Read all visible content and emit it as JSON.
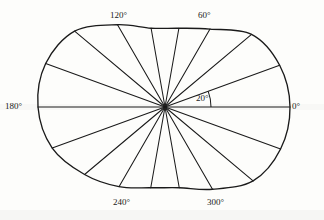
{
  "figure": {
    "title": "",
    "background_color": "#fdfdfb",
    "line_color": "#1a1a1a",
    "center": {
      "x": 165,
      "y": 107
    }
  },
  "labels": {
    "deg0": "0°",
    "deg20": "20°",
    "deg60": "60°",
    "deg120": "120°",
    "deg180": "180°",
    "deg240": "240°",
    "deg300": "300°"
  },
  "chart_data": {
    "type": "line",
    "subtype": "polar-closed-contour",
    "title": "",
    "xlabel": "",
    "ylabel": "",
    "angle_unit": "degrees",
    "angle_step": 20,
    "spoke_count": 18,
    "grid": false,
    "legend": false,
    "axis_labels_shown": [
      "0°",
      "20°",
      "60°",
      "120°",
      "180°",
      "240°",
      "300°"
    ],
    "angle_arc_annotation": {
      "label": "20°",
      "from_angle": 0,
      "to_angle": 20,
      "arc_radius": 46
    },
    "angles": [
      0,
      20,
      40,
      60,
      80,
      100,
      120,
      140,
      160,
      180,
      200,
      220,
      240,
      260,
      280,
      300,
      320,
      340
    ],
    "radii": [
      125,
      122,
      113,
      90,
      80,
      80,
      95,
      118,
      127,
      127,
      120,
      105,
      92,
      82,
      82,
      95,
      115,
      123
    ],
    "radius_units": "px",
    "rlim": [
      0,
      130
    ],
    "series": [
      {
        "name": "pattern-contour",
        "angles": [
          0,
          20,
          40,
          60,
          80,
          100,
          120,
          140,
          160,
          180,
          200,
          220,
          240,
          260,
          280,
          300,
          320,
          340
        ],
        "values": [
          125,
          122,
          113,
          90,
          80,
          80,
          95,
          118,
          127,
          127,
          120,
          105,
          92,
          82,
          82,
          95,
          115,
          123
        ]
      }
    ]
  },
  "label_positions": {
    "deg0": {
      "x": 292,
      "y": 102
    },
    "deg20": {
      "x": 196,
      "y": 94
    },
    "deg60": {
      "x": 198,
      "y": 11
    },
    "deg120": {
      "x": 110,
      "y": 11
    },
    "deg180": {
      "x": 5,
      "y": 102
    },
    "deg240": {
      "x": 113,
      "y": 198
    },
    "deg300": {
      "x": 207,
      "y": 198
    }
  }
}
